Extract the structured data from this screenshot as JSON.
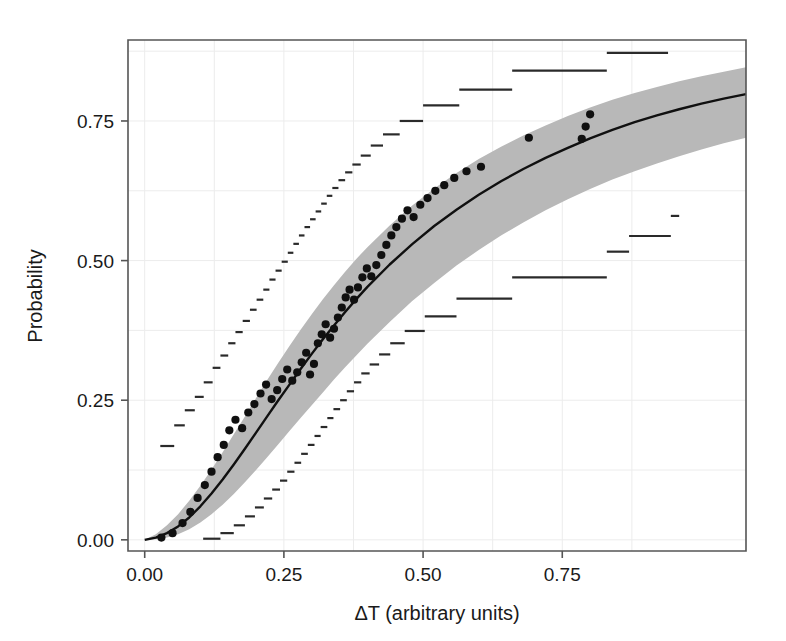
{
  "chart_data": {
    "type": "line",
    "title": "",
    "subtitle": "",
    "xlabel": "ΔT (arbitrary units)",
    "ylabel": "Probability",
    "xlim": [
      -0.03,
      1.08
    ],
    "ylim": [
      -0.02,
      0.895
    ],
    "grid": true,
    "legend": "none",
    "xticks": [
      0.0,
      0.25,
      0.5,
      0.75
    ],
    "xtick_labels": [
      "0.00",
      "0.25",
      "0.50",
      "0.75"
    ],
    "yticks": [
      0.0,
      0.25,
      0.5,
      0.75
    ],
    "ytick_labels": [
      "0.00",
      "0.25",
      "0.50",
      "0.75"
    ],
    "colors": {
      "band_fill": "#b8b8b8",
      "fit_line": "#101010",
      "points": "#101010",
      "steps": "#2a2a2a",
      "grid": "#ececec",
      "frame": "#555555",
      "background": "#ffffff",
      "text": "#1a1a1a"
    },
    "series": [
      {
        "name": "Fitted probability curve",
        "kind": "line",
        "x": [
          0.0,
          0.02,
          0.04,
          0.06,
          0.08,
          0.1,
          0.12,
          0.14,
          0.16,
          0.18,
          0.2,
          0.22,
          0.24,
          0.26,
          0.28,
          0.3,
          0.32,
          0.34,
          0.36,
          0.38,
          0.4,
          0.44,
          0.48,
          0.52,
          0.56,
          0.6,
          0.64,
          0.68,
          0.72,
          0.76,
          0.8,
          0.84,
          0.88,
          0.92,
          0.96,
          1.0,
          1.04,
          1.08
        ],
        "values": [
          0.0,
          0.004,
          0.012,
          0.024,
          0.04,
          0.06,
          0.083,
          0.108,
          0.135,
          0.163,
          0.192,
          0.221,
          0.25,
          0.278,
          0.306,
          0.333,
          0.359,
          0.384,
          0.408,
          0.431,
          0.453,
          0.493,
          0.529,
          0.562,
          0.591,
          0.618,
          0.642,
          0.664,
          0.684,
          0.702,
          0.719,
          0.734,
          0.748,
          0.76,
          0.771,
          0.781,
          0.79,
          0.798
        ]
      },
      {
        "name": "Confidence band upper",
        "kind": "band-upper",
        "x": [
          0.0,
          0.02,
          0.04,
          0.06,
          0.08,
          0.1,
          0.12,
          0.14,
          0.16,
          0.18,
          0.2,
          0.22,
          0.24,
          0.26,
          0.28,
          0.3,
          0.32,
          0.34,
          0.36,
          0.38,
          0.4,
          0.44,
          0.48,
          0.52,
          0.56,
          0.6,
          0.64,
          0.68,
          0.72,
          0.76,
          0.8,
          0.84,
          0.88,
          0.92,
          0.96,
          1.0,
          1.04,
          1.08
        ],
        "values": [
          0.0,
          0.01,
          0.026,
          0.046,
          0.07,
          0.097,
          0.126,
          0.157,
          0.189,
          0.221,
          0.254,
          0.286,
          0.317,
          0.347,
          0.376,
          0.404,
          0.431,
          0.456,
          0.48,
          0.503,
          0.524,
          0.563,
          0.598,
          0.629,
          0.657,
          0.682,
          0.704,
          0.724,
          0.742,
          0.759,
          0.774,
          0.788,
          0.8,
          0.811,
          0.821,
          0.83,
          0.838,
          0.846
        ]
      },
      {
        "name": "Confidence band lower",
        "kind": "band-lower",
        "x": [
          0.0,
          0.02,
          0.04,
          0.06,
          0.08,
          0.1,
          0.12,
          0.14,
          0.16,
          0.18,
          0.2,
          0.22,
          0.24,
          0.26,
          0.28,
          0.3,
          0.32,
          0.34,
          0.36,
          0.38,
          0.4,
          0.44,
          0.48,
          0.52,
          0.56,
          0.6,
          0.64,
          0.68,
          0.72,
          0.76,
          0.8,
          0.84,
          0.88,
          0.92,
          0.96,
          1.0,
          1.04,
          1.08
        ],
        "values": [
          0.0,
          0.001,
          0.004,
          0.01,
          0.019,
          0.031,
          0.046,
          0.063,
          0.082,
          0.103,
          0.125,
          0.148,
          0.171,
          0.195,
          0.218,
          0.241,
          0.264,
          0.287,
          0.309,
          0.33,
          0.351,
          0.39,
          0.427,
          0.46,
          0.491,
          0.519,
          0.545,
          0.568,
          0.59,
          0.61,
          0.628,
          0.645,
          0.66,
          0.674,
          0.687,
          0.699,
          0.71,
          0.72
        ]
      },
      {
        "name": "Observed proportions",
        "kind": "scatter",
        "points": [
          [
            0.03,
            0.004
          ],
          [
            0.05,
            0.012
          ],
          [
            0.068,
            0.03
          ],
          [
            0.082,
            0.05
          ],
          [
            0.095,
            0.075
          ],
          [
            0.108,
            0.098
          ],
          [
            0.12,
            0.122
          ],
          [
            0.131,
            0.148
          ],
          [
            0.142,
            0.17
          ],
          [
            0.152,
            0.196
          ],
          [
            0.163,
            0.215
          ],
          [
            0.175,
            0.2
          ],
          [
            0.186,
            0.228
          ],
          [
            0.197,
            0.243
          ],
          [
            0.208,
            0.262
          ],
          [
            0.218,
            0.278
          ],
          [
            0.228,
            0.252
          ],
          [
            0.238,
            0.268
          ],
          [
            0.247,
            0.288
          ],
          [
            0.256,
            0.305
          ],
          [
            0.265,
            0.285
          ],
          [
            0.274,
            0.3
          ],
          [
            0.282,
            0.318
          ],
          [
            0.29,
            0.335
          ],
          [
            0.297,
            0.296
          ],
          [
            0.304,
            0.315
          ],
          [
            0.311,
            0.352
          ],
          [
            0.318,
            0.368
          ],
          [
            0.325,
            0.386
          ],
          [
            0.333,
            0.362
          ],
          [
            0.34,
            0.378
          ],
          [
            0.347,
            0.398
          ],
          [
            0.354,
            0.416
          ],
          [
            0.361,
            0.434
          ],
          [
            0.368,
            0.448
          ],
          [
            0.376,
            0.43
          ],
          [
            0.383,
            0.452
          ],
          [
            0.391,
            0.47
          ],
          [
            0.399,
            0.486
          ],
          [
            0.407,
            0.472
          ],
          [
            0.416,
            0.492
          ],
          [
            0.425,
            0.51
          ],
          [
            0.434,
            0.528
          ],
          [
            0.443,
            0.545
          ],
          [
            0.452,
            0.56
          ],
          [
            0.462,
            0.575
          ],
          [
            0.472,
            0.59
          ],
          [
            0.483,
            0.578
          ],
          [
            0.495,
            0.6
          ],
          [
            0.508,
            0.612
          ],
          [
            0.522,
            0.625
          ],
          [
            0.538,
            0.635
          ],
          [
            0.556,
            0.648
          ],
          [
            0.578,
            0.66
          ],
          [
            0.604,
            0.668
          ],
          [
            0.69,
            0.72
          ],
          [
            0.785,
            0.718
          ],
          [
            0.792,
            0.74
          ],
          [
            0.8,
            0.762
          ]
        ]
      },
      {
        "name": "Outer bound upper step",
        "kind": "step",
        "points": [
          [
            0.028,
            0.168
          ],
          [
            0.053,
            0.168
          ],
          [
            0.053,
            0.205
          ],
          [
            0.072,
            0.205
          ],
          [
            0.072,
            0.232
          ],
          [
            0.09,
            0.232
          ],
          [
            0.09,
            0.256
          ],
          [
            0.106,
            0.256
          ],
          [
            0.106,
            0.282
          ],
          [
            0.122,
            0.282
          ],
          [
            0.122,
            0.308
          ],
          [
            0.136,
            0.308
          ],
          [
            0.136,
            0.33
          ],
          [
            0.15,
            0.33
          ],
          [
            0.15,
            0.352
          ],
          [
            0.163,
            0.352
          ],
          [
            0.163,
            0.372
          ],
          [
            0.176,
            0.372
          ],
          [
            0.176,
            0.392
          ],
          [
            0.189,
            0.392
          ],
          [
            0.189,
            0.412
          ],
          [
            0.201,
            0.412
          ],
          [
            0.201,
            0.43
          ],
          [
            0.213,
            0.43
          ],
          [
            0.213,
            0.448
          ],
          [
            0.224,
            0.448
          ],
          [
            0.224,
            0.466
          ],
          [
            0.235,
            0.466
          ],
          [
            0.235,
            0.482
          ],
          [
            0.246,
            0.482
          ],
          [
            0.246,
            0.498
          ],
          [
            0.257,
            0.498
          ],
          [
            0.257,
            0.514
          ],
          [
            0.267,
            0.514
          ],
          [
            0.267,
            0.53
          ],
          [
            0.277,
            0.53
          ],
          [
            0.277,
            0.545
          ],
          [
            0.287,
            0.545
          ],
          [
            0.287,
            0.56
          ],
          [
            0.297,
            0.56
          ],
          [
            0.297,
            0.574
          ],
          [
            0.307,
            0.574
          ],
          [
            0.307,
            0.588
          ],
          [
            0.317,
            0.588
          ],
          [
            0.317,
            0.602
          ],
          [
            0.327,
            0.602
          ],
          [
            0.327,
            0.616
          ],
          [
            0.337,
            0.616
          ],
          [
            0.337,
            0.63
          ],
          [
            0.348,
            0.63
          ],
          [
            0.348,
            0.644
          ],
          [
            0.36,
            0.644
          ],
          [
            0.36,
            0.658
          ],
          [
            0.373,
            0.658
          ],
          [
            0.373,
            0.672
          ],
          [
            0.388,
            0.672
          ],
          [
            0.388,
            0.688
          ],
          [
            0.406,
            0.688
          ],
          [
            0.406,
            0.706
          ],
          [
            0.428,
            0.706
          ],
          [
            0.428,
            0.726
          ],
          [
            0.458,
            0.726
          ],
          [
            0.458,
            0.75
          ],
          [
            0.5,
            0.75
          ],
          [
            0.5,
            0.778
          ],
          [
            0.565,
            0.778
          ],
          [
            0.565,
            0.806
          ],
          [
            0.66,
            0.806
          ],
          [
            0.66,
            0.84
          ],
          [
            0.83,
            0.84
          ],
          [
            0.83,
            0.872
          ],
          [
            0.94,
            0.872
          ]
        ]
      },
      {
        "name": "Outer bound lower step",
        "kind": "step",
        "points": [
          [
            0.105,
            0.002
          ],
          [
            0.136,
            0.002
          ],
          [
            0.136,
            0.012
          ],
          [
            0.16,
            0.012
          ],
          [
            0.16,
            0.026
          ],
          [
            0.18,
            0.026
          ],
          [
            0.18,
            0.042
          ],
          [
            0.198,
            0.042
          ],
          [
            0.198,
            0.058
          ],
          [
            0.214,
            0.058
          ],
          [
            0.214,
            0.074
          ],
          [
            0.229,
            0.074
          ],
          [
            0.229,
            0.09
          ],
          [
            0.243,
            0.09
          ],
          [
            0.243,
            0.106
          ],
          [
            0.256,
            0.106
          ],
          [
            0.256,
            0.122
          ],
          [
            0.269,
            0.122
          ],
          [
            0.269,
            0.138
          ],
          [
            0.281,
            0.138
          ],
          [
            0.281,
            0.154
          ],
          [
            0.293,
            0.154
          ],
          [
            0.293,
            0.17
          ],
          [
            0.305,
            0.17
          ],
          [
            0.305,
            0.186
          ],
          [
            0.316,
            0.186
          ],
          [
            0.316,
            0.202
          ],
          [
            0.328,
            0.202
          ],
          [
            0.328,
            0.218
          ],
          [
            0.339,
            0.218
          ],
          [
            0.339,
            0.234
          ],
          [
            0.351,
            0.234
          ],
          [
            0.351,
            0.25
          ],
          [
            0.363,
            0.25
          ],
          [
            0.363,
            0.266
          ],
          [
            0.376,
            0.266
          ],
          [
            0.376,
            0.282
          ],
          [
            0.389,
            0.282
          ],
          [
            0.389,
            0.298
          ],
          [
            0.404,
            0.298
          ],
          [
            0.404,
            0.314
          ],
          [
            0.421,
            0.314
          ],
          [
            0.421,
            0.332
          ],
          [
            0.441,
            0.332
          ],
          [
            0.441,
            0.352
          ],
          [
            0.467,
            0.352
          ],
          [
            0.467,
            0.374
          ],
          [
            0.503,
            0.374
          ],
          [
            0.503,
            0.4
          ],
          [
            0.56,
            0.4
          ],
          [
            0.56,
            0.432
          ],
          [
            0.66,
            0.432
          ],
          [
            0.66,
            0.47
          ],
          [
            0.83,
            0.47
          ],
          [
            0.83,
            0.516
          ],
          [
            0.87,
            0.516
          ],
          [
            0.87,
            0.544
          ],
          [
            0.945,
            0.544
          ],
          [
            0.945,
            0.58
          ],
          [
            0.96,
            0.58
          ]
        ]
      }
    ]
  }
}
